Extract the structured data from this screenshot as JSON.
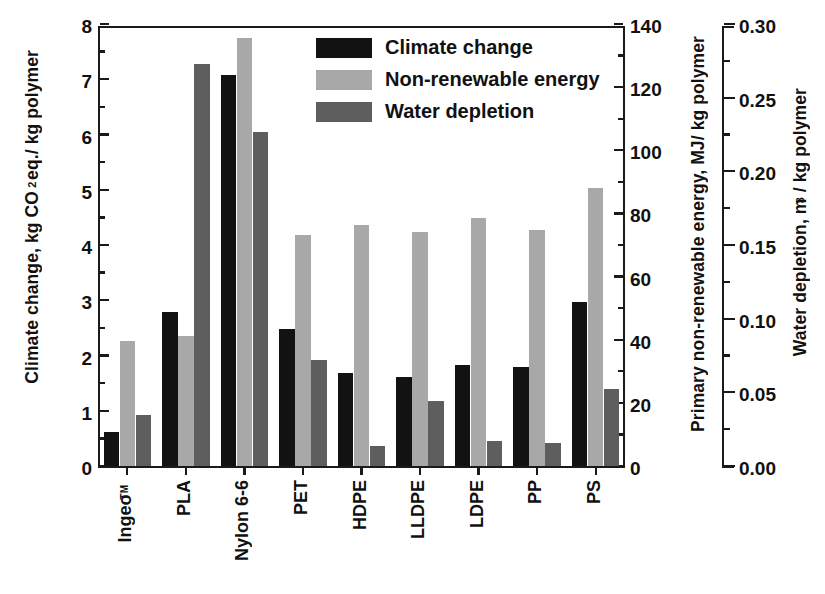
{
  "chart_data": {
    "type": "bar",
    "title": "",
    "categories": [
      "Ingeo™",
      "PLA",
      "Nylon 6-6",
      "PET",
      "HDPE",
      "LLDPE",
      "LDPE",
      "PP",
      "PS"
    ],
    "series": [
      {
        "name": "Climate change",
        "color": "#121212",
        "axis": "left",
        "unit": "kg CO2 eq./ kg polymer",
        "values": [
          0.62,
          2.79,
          7.07,
          2.48,
          1.69,
          1.62,
          1.83,
          1.79,
          2.97
        ]
      },
      {
        "name": "Non-renewable energy",
        "color": "#a8a8a8",
        "axis": "right-1",
        "unit": "MJ/ kg polymer",
        "values_left_scale": [
          2.27,
          2.36,
          7.75,
          4.18,
          4.37,
          4.24,
          4.49,
          4.28,
          5.03
        ],
        "values": [
          39.7,
          41.3,
          135.6,
          73.2,
          76.5,
          74.2,
          78.6,
          74.9,
          88.0
        ]
      },
      {
        "name": "Water depletion",
        "color": "#5e5e5e",
        "axis": "right-2",
        "unit": "m3/ kg polymer",
        "values_left_scale": [
          0.93,
          7.27,
          6.04,
          1.92,
          0.36,
          1.18,
          0.46,
          0.41,
          1.39
        ],
        "values": [
          0.035,
          0.273,
          0.227,
          0.072,
          0.013,
          0.044,
          0.017,
          0.015,
          0.052
        ]
      }
    ],
    "axes": {
      "left": {
        "label_parts": [
          "Climate change, kg CO",
          "2",
          " eq./ kg polymer"
        ],
        "label": "Climate change, kg CO2 eq./ kg polymer",
        "min": 0,
        "max": 8,
        "ticks": [
          0,
          1,
          2,
          3,
          4,
          5,
          6,
          7,
          8
        ],
        "minor_step": 0.5
      },
      "right_1": {
        "label": "Primary non-renewable energy, MJ/ kg polymer",
        "min": 0,
        "max": 140,
        "ticks": [
          0,
          20,
          40,
          60,
          80,
          100,
          120,
          140
        ],
        "minor_step": 10
      },
      "right_2": {
        "label_parts": [
          "Water depletion, m",
          "3",
          "/ kg polymer"
        ],
        "label": "Water depletion, m3/ kg polymer",
        "min": 0.0,
        "max": 0.3,
        "ticks": [
          "0.00",
          "0.05",
          "0.10",
          "0.15",
          "0.20",
          "0.25",
          "0.30"
        ],
        "minor_step": 0.025
      },
      "x": {
        "label": "",
        "grid": false
      }
    },
    "legend": {
      "position": "top-center-right",
      "entries": [
        "Climate change",
        "Non-renewable energy",
        "Water depletion"
      ]
    },
    "grid": false
  },
  "legend": {
    "items": [
      {
        "label": "Climate change",
        "swatch": "s0"
      },
      {
        "label": "Non-renewable energy",
        "swatch": "s1"
      },
      {
        "label": "Water depletion",
        "swatch": "s2"
      }
    ]
  },
  "axis_left": {
    "title_a": "Climate change, kg CO",
    "title_sub": "2",
    "title_b": " eq./ kg polymer",
    "tick_labels": [
      "8",
      "7",
      "6",
      "5",
      "4",
      "3",
      "2",
      "1",
      "0"
    ]
  },
  "axis_mid": {
    "title": "Primary non-renewable energy, MJ/ kg polymer",
    "tick_labels": [
      "140",
      "120",
      "100",
      "80",
      "60",
      "40",
      "20",
      "0"
    ]
  },
  "axis_right": {
    "title_a": "Water depletion, m",
    "title_sup": "3",
    "title_b": "/ kg polymer",
    "tick_labels": [
      "0.30",
      "0.25",
      "0.20",
      "0.15",
      "0.10",
      "0.05",
      "0.00"
    ]
  },
  "x_axis": {
    "tick_labels": [
      "Ingeo",
      "PLA",
      "Nylon 6-6",
      "PET",
      "HDPE",
      "LLDPE",
      "LDPE",
      "PP",
      "PS"
    ],
    "ingeo_sup": "TM"
  }
}
